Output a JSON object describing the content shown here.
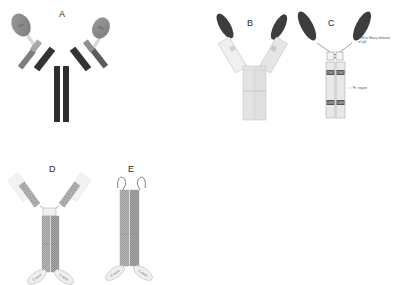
{
  "figure": {
    "background": "#ffffff",
    "width": 395,
    "height": 285
  },
  "panels": [
    {
      "id": "A",
      "letter": "A",
      "description": "Conventional IgG antibody with two variable-domain ellipses",
      "ellipse_labels": [
        "LEL",
        "LEC"
      ],
      "colors": {
        "heavy": "#3a3a3a",
        "light": "#7d7d7d",
        "ellipse": "#8c8c8c"
      }
    },
    {
      "id": "B",
      "letter": "B",
      "description": "Antibody with dark elongated variable tips and pale Fc stem",
      "ellipse_labels": [],
      "colors": {
        "tip": "#3d3d3d",
        "arm": "#e3e3e3",
        "stem": "#dcdcdc"
      }
    },
    {
      "id": "C",
      "letter": "C",
      "description": "Fc-fusion construct with hinge, CH2 and CH3 domains",
      "domain_labels": [
        "CH2",
        "CH3",
        "CH2",
        "CH3"
      ],
      "annotations": {
        "tip": "VHH or Heavy domains of IgG",
        "fc": "Fc region"
      },
      "colors": {
        "tip": "#3d3d3d",
        "stem": "#e0e0e0",
        "domain_box": "#555555"
      }
    },
    {
      "id": "D",
      "letter": "D",
      "description": "Y-shaped antibody with hatched stem and two bottom ellipse tags",
      "ellipse_labels": [
        "C-term",
        "C-term"
      ],
      "colors": {
        "stem": "#9a9a9a",
        "arm": "#8f8f8f",
        "ellipse": "#efefef"
      }
    },
    {
      "id": "E",
      "letter": "E",
      "description": "Linear dimer construct with curled N-termini and two bottom ellipse tags",
      "ellipse_labels": [
        "C-term",
        "C-term"
      ],
      "colors": {
        "stem": "#9a9a9a",
        "ellipse": "#efefef"
      }
    }
  ],
  "colors": {
    "background": "#ffffff",
    "dark": "#3a3a3a",
    "mid": "#7d7d7d",
    "light": "#dcdcdc",
    "text": "#4a4a4a"
  }
}
